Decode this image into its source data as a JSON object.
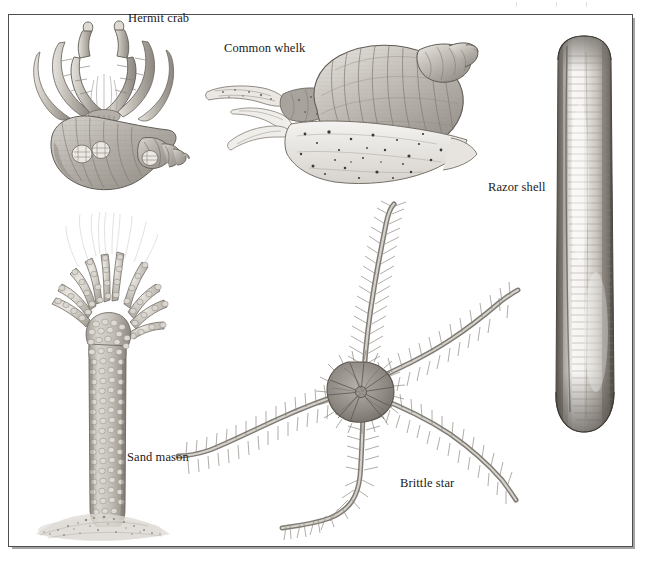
{
  "plate": {
    "title": "Seashore creatures illustration plate",
    "background_color": "#ffffff",
    "frame_color": "#4e4e4e",
    "ink_color": "#6b6b6b",
    "label_color": "#1a1a1a",
    "width": 646,
    "height": 569
  },
  "labels": {
    "hermit_crab": "Hermit crab",
    "common_whelk": "Common whelk",
    "razor_shell": "Razor shell",
    "sand_mason": "Sand mason",
    "brittle_star": "Brittle star"
  },
  "figures": [
    {
      "name": "hermit-crab",
      "label": "Hermit crab",
      "description": "Hermit crab occupying a spiral gastropod shell, two large claws and walking legs projecting forward",
      "label_position": "top-right of figure"
    },
    {
      "name": "common-whelk",
      "label": "Common whelk",
      "description": "Common whelk with tall spired shell, extended siphon and tentacles to the left, speckled muscular foot below",
      "label_position": "upper-left of figure"
    },
    {
      "name": "razor-shell",
      "label": "Razor shell",
      "description": "Long narrow vertical razor shell with fine growth lines and dark margins",
      "label_position": "left of figure"
    },
    {
      "name": "sand-mason",
      "label": "Sand mason",
      "description": "Sand mason worm tube built of sand grains and shell fragments, with branching fronds at the crown, rising from a sandy mound",
      "label_position": "right of tube"
    },
    {
      "name": "brittle-star",
      "label": "Brittle star",
      "description": "Brittle star with a central disc and five long spiny flexible arms",
      "label_position": "lower-right of figure"
    }
  ]
}
